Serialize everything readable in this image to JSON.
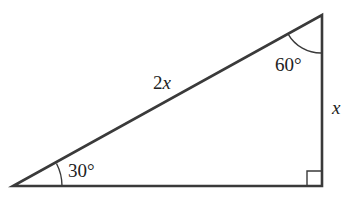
{
  "diagram": {
    "type": "right-triangle",
    "stroke_color": "#3a3a3a",
    "text_color": "#222222",
    "vertices": {
      "bottom_left": [
        13,
        186
      ],
      "bottom_right": [
        322,
        186
      ],
      "top": [
        322,
        15
      ]
    },
    "angles": {
      "bottom_left": {
        "value": "30°",
        "label_pos": [
          68,
          177
        ]
      },
      "top": {
        "value": "60°",
        "label_pos": [
          275,
          71
        ]
      },
      "bottom_right": {
        "value": "90°",
        "marker": "right-angle-square"
      }
    },
    "sides": {
      "hypotenuse": {
        "coef": "2",
        "var": "x",
        "label_pos": [
          153,
          89
        ]
      },
      "vertical_leg": {
        "var": "x",
        "label_pos": [
          332,
          114
        ]
      },
      "horizontal_leg": {
        "label": ""
      }
    }
  }
}
